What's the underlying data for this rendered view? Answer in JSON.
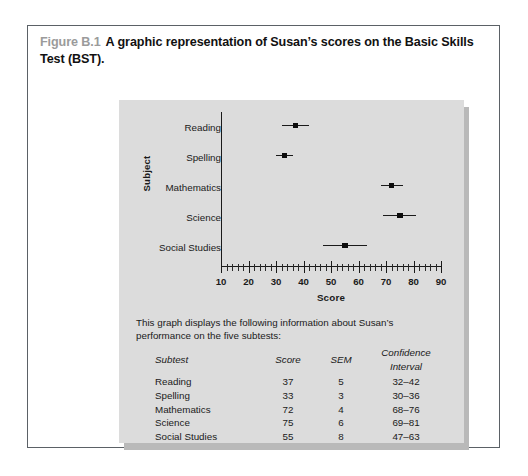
{
  "caption": {
    "figure_number": "Figure B.1",
    "text": "A graphic representation of Susan’s scores on the Basic Skills Test (BST)."
  },
  "chart_data": {
    "type": "scatter",
    "title": "",
    "xlabel": "Score",
    "ylabel": "Subject",
    "xlim": [
      10,
      90
    ],
    "xticks": [
      10,
      20,
      30,
      40,
      50,
      60,
      70,
      80,
      90
    ],
    "xtick_labels": [
      "10",
      "20",
      "30",
      "40",
      "50",
      "60",
      "70",
      "80",
      "90"
    ],
    "minor_ticks_per_major": 5,
    "grid": false,
    "legend": "none",
    "categories": [
      "Reading",
      "Spelling",
      "Mathematics",
      "Science",
      "Social Studies"
    ],
    "values": [
      37,
      33,
      72,
      75,
      55
    ],
    "error_low": [
      32,
      30,
      68,
      69,
      47
    ],
    "error_high": [
      42,
      36,
      76,
      81,
      63
    ],
    "series": [
      {
        "name": "Score with confidence interval",
        "points": [
          {
            "category": "Reading",
            "score": 37,
            "sem": 5,
            "ci_low": 32,
            "ci_high": 42
          },
          {
            "category": "Spelling",
            "score": 33,
            "sem": 3,
            "ci_low": 30,
            "ci_high": 36
          },
          {
            "category": "Mathematics",
            "score": 72,
            "sem": 4,
            "ci_low": 68,
            "ci_high": 76
          },
          {
            "category": "Science",
            "score": 75,
            "sem": 6,
            "ci_low": 69,
            "ci_high": 81
          },
          {
            "category": "Social Studies",
            "score": 55,
            "sem": 8,
            "ci_low": 47,
            "ci_high": 63
          }
        ]
      }
    ],
    "marker_color": "#0d0d0d",
    "axis_color": "#1a1a1a",
    "panel_color": "#dcdcdc"
  },
  "description": {
    "line1": "This graph displays the following information about Susan’s performance",
    "line2": "on the five subtests:"
  },
  "table": {
    "headers": {
      "subtest": "Subtest",
      "score": "Score",
      "sem": "SEM",
      "ci": "Confidence Interval"
    },
    "rows": [
      {
        "subtest": "Reading",
        "score": "37",
        "sem": "5",
        "ci": "32–42"
      },
      {
        "subtest": "Spelling",
        "score": "33",
        "sem": "3",
        "ci": "30–36"
      },
      {
        "subtest": "Mathematics",
        "score": "72",
        "sem": "4",
        "ci": "68–76"
      },
      {
        "subtest": "Science",
        "score": "75",
        "sem": "6",
        "ci": "69–81"
      },
      {
        "subtest": "Social Studies",
        "score": "55",
        "sem": "8",
        "ci": "47–63"
      }
    ]
  }
}
